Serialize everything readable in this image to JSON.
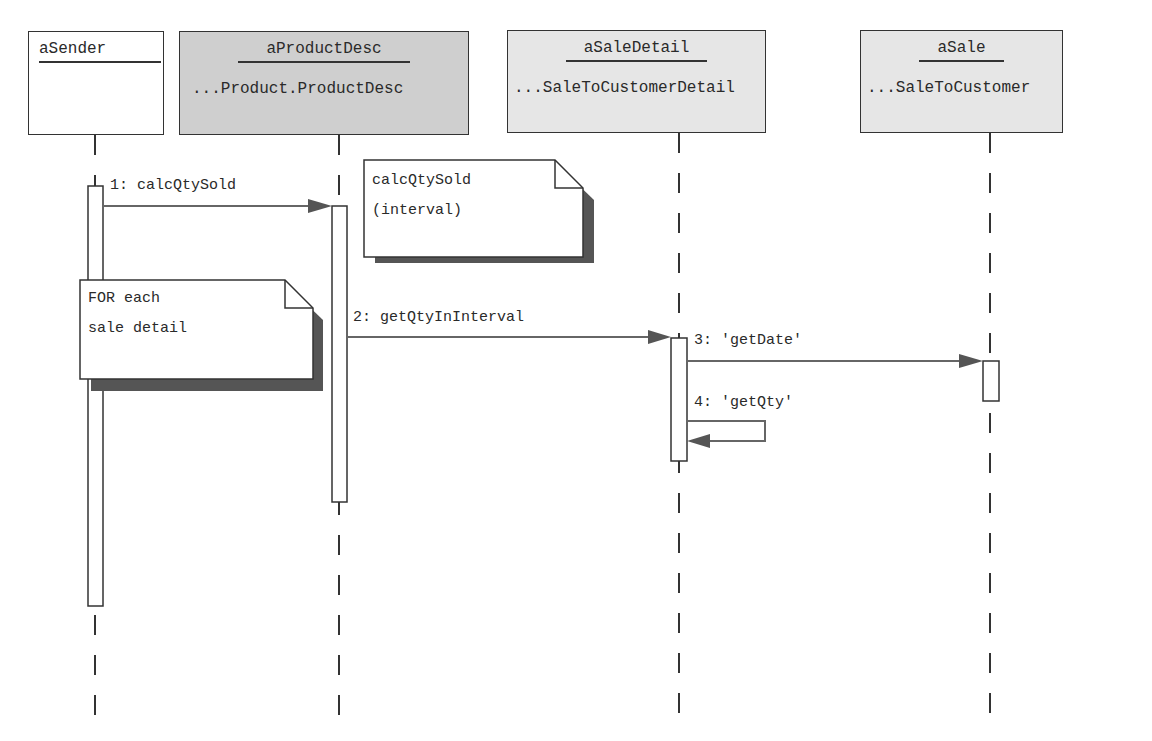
{
  "objects": [
    {
      "name": "aSender",
      "class": "",
      "fill": "#ffffff"
    },
    {
      "name": "aProductDesc",
      "class": "...Product.ProductDesc",
      "fill": "#d0d0d0"
    },
    {
      "name": "aSaleDetail",
      "class": "...SaleToCustomerDetail",
      "fill": "#e6e6e6"
    },
    {
      "name": "aSale",
      "class": "...SaleToCustomer",
      "fill": "#e6e6e6"
    }
  ],
  "messages": [
    {
      "label": "1: calcQtySold",
      "from": "aSender",
      "to": "aProductDesc"
    },
    {
      "label": "2: getQtyInInterval",
      "from": "aProductDesc",
      "to": "aSaleDetail"
    },
    {
      "label": "3: 'getDate'",
      "from": "aSaleDetail",
      "to": "aSale"
    },
    {
      "label": "4: 'getQty'",
      "from": "aSaleDetail",
      "to": "aSaleDetail"
    }
  ],
  "notes": [
    {
      "text": "calcQtySold\n(interval)"
    },
    {
      "text": "FOR each\nsale detail"
    }
  ],
  "colors": {
    "line": "#333333",
    "arrow": "#555555",
    "shadow": "#555555"
  }
}
